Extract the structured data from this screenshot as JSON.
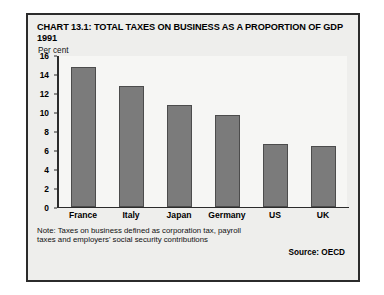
{
  "chart_data": {
    "type": "bar",
    "title": "CHART 13.1: TOTAL TAXES ON BUSINESS AS A PROPORTION OF GDP 1991",
    "xlabel": "",
    "ylabel": "Per cent",
    "categories": [
      "France",
      "Italy",
      "Japan",
      "Germany",
      "US",
      "UK"
    ],
    "values": [
      14.8,
      12.8,
      10.8,
      9.7,
      6.7,
      6.5
    ],
    "ylim": [
      0,
      16
    ],
    "yticks": [
      0,
      2,
      4,
      6,
      8,
      10,
      12,
      14,
      16
    ],
    "grid": false,
    "legend": null,
    "bar_color": "#7b7b7b",
    "bar_edge_color": "#4c4c4c",
    "note": "Note: Taxes on business defined as corporation tax, payroll taxes and employers' social security contributions",
    "source": "Source: OECD"
  },
  "panel": {
    "background": "#eeeeec",
    "border_color": "#2b2b2b"
  }
}
